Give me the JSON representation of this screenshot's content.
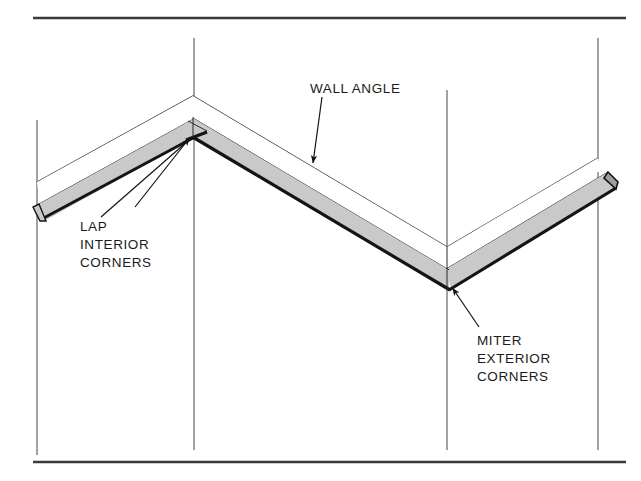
{
  "figure": {
    "type": "technical-line-diagram",
    "background_color": "#ffffff",
    "line_color": "#1a1a1a",
    "molding_face_color": "#c9c9c9",
    "molding_edge_color": "#111111",
    "wall_line_color": "#4a4a4a"
  },
  "rules": {
    "top_rule": {
      "x1": 33,
      "y1": 18,
      "x2": 626,
      "y2": 18,
      "thickness": 2.4
    },
    "bottom_rule": {
      "x1": 33,
      "y1": 462,
      "x2": 626,
      "y2": 462,
      "thickness": 2.4
    }
  },
  "wall_lines": [
    {
      "name": "wall-corner-line-far-left",
      "x": 37,
      "y_top": 120,
      "y_bottom": 455
    },
    {
      "name": "wall-corner-line-interior",
      "x": 194,
      "y_top": 38,
      "y_bottom": 450
    },
    {
      "name": "wall-corner-line-exterior",
      "x": 447,
      "y_top": 90,
      "y_bottom": 450
    },
    {
      "name": "wall-corner-line-far-right",
      "x": 598,
      "y_top": 38,
      "y_bottom": 450
    }
  ],
  "molding": {
    "description": "Wall angle run spanning two corners: a peak (interior corner) at left and a valley (exterior corner) at right",
    "vertices": {
      "left_end": {
        "x": 40,
        "y": 213
      },
      "peak_interior_corner": {
        "x": 193,
        "y": 128
      },
      "valley_exterior_corner": {
        "x": 448,
        "y": 278
      },
      "right_end": {
        "x": 612,
        "y": 184
      }
    },
    "band_thickness_px": 22,
    "top_wall_line_offset_px": 32
  },
  "labels": [
    {
      "id": "wall-angle",
      "text": "WALL ANGLE",
      "lines": [
        "WALL ANGLE"
      ],
      "text_x": 310,
      "text_y": 88,
      "anchor": "start",
      "leader": {
        "x1": 322,
        "y1": 97,
        "x2": 313,
        "y2": 164
      },
      "arrow_at": {
        "x": 313,
        "y": 164
      }
    },
    {
      "id": "lap-interior-corners",
      "text": "LAP INTERIOR CORNERS",
      "lines": [
        "LAP",
        "INTERIOR",
        "CORNERS"
      ],
      "text_x": 80,
      "text_y": 231,
      "line_height": 18,
      "anchor": "start",
      "leader": {
        "x1": 135,
        "y1": 206,
        "x2": 190,
        "y2": 136
      },
      "leader_secondary": {
        "x1": 107,
        "y1": 213,
        "x2": 189,
        "y2": 137
      },
      "arrow_at": {
        "x": 190,
        "y": 136
      }
    },
    {
      "id": "miter-exterior-corners",
      "text": "MITER EXTERIOR CORNERS",
      "lines": [
        "MITER",
        "EXTERIOR",
        "CORNERS"
      ],
      "text_x": 477,
      "text_y": 345,
      "line_height": 18,
      "anchor": "start",
      "leader": {
        "x1": 478,
        "y1": 325,
        "x2": 452,
        "y2": 287
      },
      "arrow_at": {
        "x": 452,
        "y": 287
      }
    }
  ]
}
